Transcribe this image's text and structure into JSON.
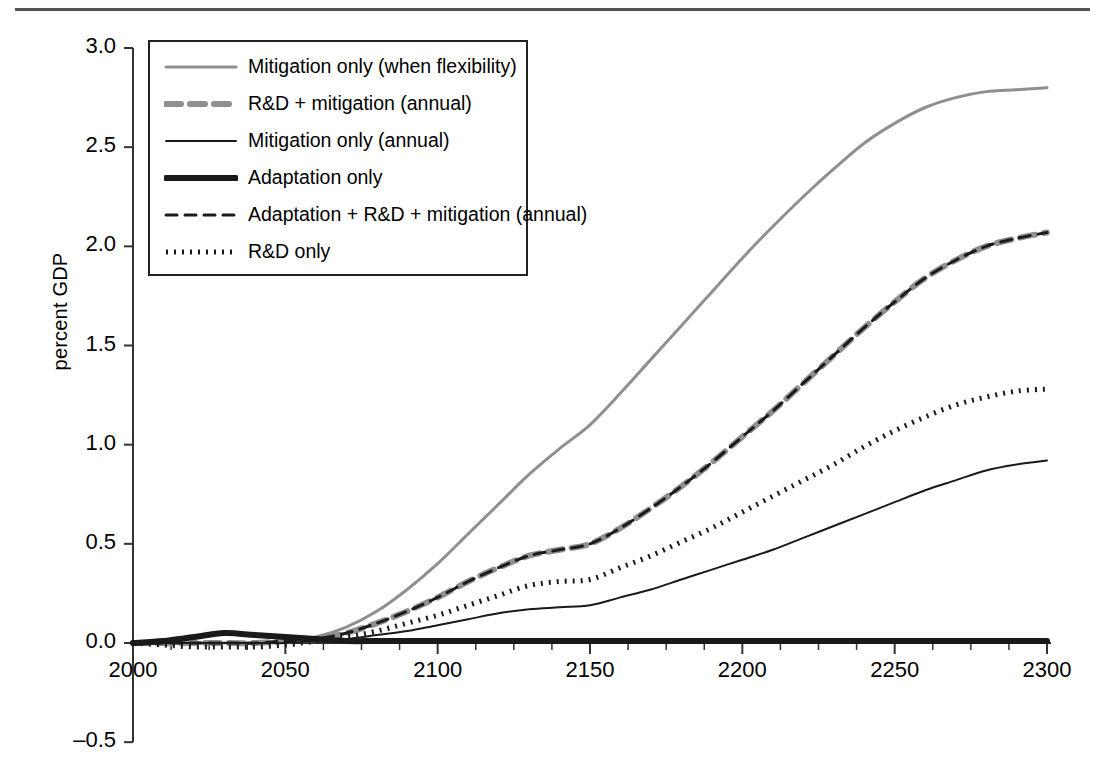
{
  "axes": {
    "ylabel": "percent GDP",
    "yticks": [
      "3.0",
      "2.5",
      "2.0",
      "1.5",
      "1.0",
      "0.5",
      "0.0",
      "-0.5"
    ],
    "ytick_values": [
      3.0,
      2.5,
      2.0,
      1.5,
      1.0,
      0.5,
      0.0,
      -0.5
    ],
    "xticks": [
      "2000",
      "2050",
      "2100",
      "2150",
      "2200",
      "2250",
      "2300"
    ],
    "xtick_values": [
      2000,
      2050,
      2100,
      2150,
      2200,
      2250,
      2300
    ]
  },
  "legend": {
    "items": [
      {
        "label": "Mitigation only (when flexibility)",
        "style": "solid",
        "color": "#8f8f8f",
        "width": 3
      },
      {
        "label": "R&D + mitigation (annual)",
        "style": "dashed",
        "color": "#8f8f8f",
        "width": 6,
        "dash": "15,9"
      },
      {
        "label": "Mitigation only (annual)",
        "style": "solid",
        "color": "#1a1a1a",
        "width": 2
      },
      {
        "label": "Adaptation only",
        "style": "solid",
        "color": "#1a1a1a",
        "width": 6
      },
      {
        "label": "Adaptation + R&D + mitigation (annual)",
        "style": "dashed",
        "color": "#1a1a1a",
        "width": 3,
        "dash": "11,8"
      },
      {
        "label": "R&D only",
        "style": "dotted",
        "color": "#1a1a1a",
        "width": 5,
        "dash": "2,6"
      }
    ]
  },
  "chart_data": {
    "type": "line",
    "title": "",
    "xlabel": "",
    "ylabel": "percent GDP",
    "xlim": [
      2000,
      2300
    ],
    "ylim": [
      -0.5,
      3.0
    ],
    "grid": false,
    "legend_position": "top-left inside plot",
    "x": [
      2000,
      2010,
      2020,
      2030,
      2040,
      2050,
      2060,
      2070,
      2080,
      2090,
      2100,
      2110,
      2120,
      2130,
      2140,
      2150,
      2160,
      2170,
      2180,
      2190,
      2200,
      2210,
      2220,
      2230,
      2240,
      2250,
      2260,
      2270,
      2280,
      2290,
      2300
    ],
    "series": [
      {
        "name": "Mitigation only (when flexibility)",
        "color": "#8f8f8f",
        "style": "solid",
        "values": [
          0.0,
          0.0,
          0.0,
          0.0,
          0.0,
          0.01,
          0.03,
          0.08,
          0.16,
          0.27,
          0.4,
          0.55,
          0.7,
          0.85,
          0.98,
          1.1,
          1.26,
          1.43,
          1.6,
          1.77,
          1.94,
          2.1,
          2.25,
          2.39,
          2.52,
          2.62,
          2.7,
          2.75,
          2.78,
          2.79,
          2.8
        ]
      },
      {
        "name": "R&D + mitigation (annual)",
        "color": "#8f8f8f",
        "style": "dashed",
        "values": [
          0.0,
          0.0,
          0.0,
          0.0,
          0.0,
          0.01,
          0.02,
          0.05,
          0.1,
          0.16,
          0.23,
          0.31,
          0.38,
          0.44,
          0.47,
          0.5,
          0.58,
          0.68,
          0.79,
          0.91,
          1.04,
          1.17,
          1.31,
          1.45,
          1.59,
          1.72,
          1.84,
          1.93,
          2.0,
          2.04,
          2.07
        ]
      },
      {
        "name": "Mitigation only (annual)",
        "color": "#1a1a1a",
        "style": "solid",
        "values": [
          0.0,
          0.0,
          0.0,
          0.0,
          0.0,
          0.0,
          0.01,
          0.02,
          0.04,
          0.06,
          0.09,
          0.12,
          0.15,
          0.17,
          0.18,
          0.19,
          0.23,
          0.27,
          0.32,
          0.37,
          0.42,
          0.47,
          0.53,
          0.59,
          0.65,
          0.71,
          0.77,
          0.82,
          0.87,
          0.9,
          0.92
        ]
      },
      {
        "name": "Adaptation only",
        "color": "#1a1a1a",
        "style": "solid",
        "values": [
          0.0,
          0.01,
          0.03,
          0.05,
          0.04,
          0.03,
          0.02,
          0.01,
          0.01,
          0.01,
          0.01,
          0.01,
          0.01,
          0.01,
          0.01,
          0.01,
          0.01,
          0.01,
          0.01,
          0.01,
          0.01,
          0.01,
          0.01,
          0.01,
          0.01,
          0.01,
          0.01,
          0.01,
          0.01,
          0.01,
          0.01
        ]
      },
      {
        "name": "Adaptation + R&D + mitigation (annual)",
        "color": "#1a1a1a",
        "style": "dashed",
        "values": [
          0.0,
          0.0,
          0.0,
          0.0,
          0.0,
          0.01,
          0.02,
          0.05,
          0.1,
          0.16,
          0.23,
          0.31,
          0.38,
          0.44,
          0.47,
          0.5,
          0.58,
          0.68,
          0.79,
          0.91,
          1.04,
          1.17,
          1.31,
          1.45,
          1.59,
          1.72,
          1.84,
          1.93,
          2.0,
          2.04,
          2.07
        ]
      },
      {
        "name": "R&D only",
        "color": "#1a1a1a",
        "style": "dotted",
        "values": [
          0.0,
          -0.01,
          -0.02,
          -0.02,
          -0.02,
          -0.01,
          0.01,
          0.03,
          0.06,
          0.1,
          0.14,
          0.19,
          0.24,
          0.29,
          0.31,
          0.32,
          0.38,
          0.44,
          0.51,
          0.58,
          0.66,
          0.74,
          0.82,
          0.9,
          0.99,
          1.07,
          1.14,
          1.2,
          1.24,
          1.27,
          1.28
        ]
      }
    ]
  }
}
